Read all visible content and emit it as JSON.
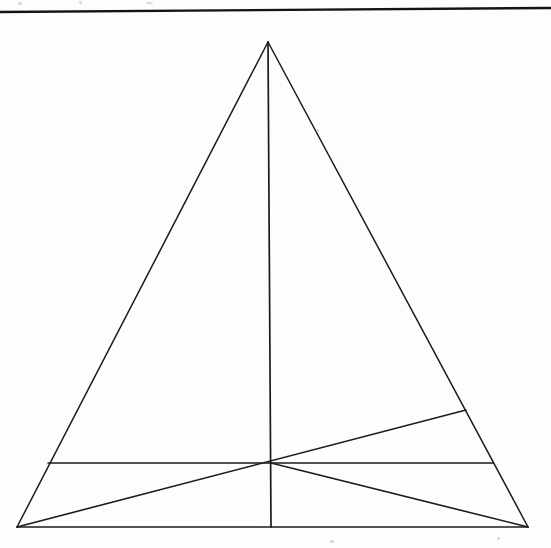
{
  "page": {
    "width": 551,
    "height": 548,
    "background_color": "#fdfdfc",
    "ink_color": "#1b1b1b"
  },
  "header_rule": {
    "name": "horizontal-rule",
    "x1": 0,
    "y1": 12,
    "x2": 551,
    "y2": 8,
    "stroke_width": 2.4,
    "color": "#141414"
  },
  "scan_artifacts": [
    {
      "x": 18,
      "y": 2,
      "w": 4,
      "h": 3
    },
    {
      "x": 79,
      "y": 1,
      "w": 3,
      "h": 3
    },
    {
      "x": 146,
      "y": 2,
      "w": 7,
      "h": 2
    },
    {
      "x": 316,
      "y": 129,
      "w": 3,
      "h": 3
    },
    {
      "x": 330,
      "y": 540,
      "w": 4,
      "h": 3
    },
    {
      "x": 497,
      "y": 537,
      "w": 3,
      "h": 3
    }
  ],
  "chart_data": {
    "type": "diagram",
    "xlabel": "",
    "ylabel": "",
    "xlim": [
      0,
      551
    ],
    "ylim": [
      0,
      548
    ],
    "grid": false,
    "legend": "none",
    "points": [
      {
        "id": "A",
        "role": "apex",
        "x": 268,
        "y": 42
      },
      {
        "id": "B",
        "role": "base-left-vertex",
        "x": 17,
        "y": 527
      },
      {
        "id": "C",
        "role": "base-right-vertex",
        "x": 528,
        "y": 527
      },
      {
        "id": "M",
        "role": "base-midpoint",
        "x": 271,
        "y": 527
      },
      {
        "id": "P",
        "role": "interior-hub",
        "x": 271,
        "y": 463
      },
      {
        "id": "L",
        "role": "chord-left-endpoint-on-left-side",
        "x": 48,
        "y": 463
      },
      {
        "id": "R",
        "role": "chord-right-endpoint-on-right-side",
        "x": 493,
        "y": 463
      },
      {
        "id": "Q",
        "role": "cevian-endpoint-on-right-side",
        "x": 466,
        "y": 410
      }
    ],
    "segments": [
      {
        "id": "s1",
        "name": "triangle-left-side",
        "from": "A",
        "to": "B",
        "x1": 268,
        "y1": 42,
        "x2": 17,
        "y2": 527,
        "stroke_width": 1.5
      },
      {
        "id": "s2",
        "name": "triangle-right-side",
        "from": "A",
        "to": "C",
        "x1": 268,
        "y1": 42,
        "x2": 528,
        "y2": 527,
        "stroke_width": 1.5
      },
      {
        "id": "s3",
        "name": "triangle-base",
        "from": "B",
        "to": "C",
        "x1": 17,
        "y1": 527,
        "x2": 528,
        "y2": 527,
        "stroke_width": 1.7
      },
      {
        "id": "s4",
        "name": "vertical-median",
        "from": "A",
        "to": "M",
        "x1": 268,
        "y1": 42,
        "x2": 271,
        "y2": 527,
        "stroke_width": 1.7
      },
      {
        "id": "s5",
        "name": "horizontal-chord",
        "from": "L",
        "to": "R",
        "x1": 48,
        "y1": 463,
        "x2": 493,
        "y2": 463,
        "stroke_width": 1.5
      },
      {
        "id": "s6",
        "name": "cevian-left-base-to-hub",
        "from": "B",
        "to": "Q",
        "x1": 17,
        "y1": 527,
        "x2": 466,
        "y2": 410,
        "stroke_width": 1.6
      },
      {
        "id": "s7",
        "name": "cevian-right-base-to-hub",
        "from": "C",
        "to": "P",
        "x1": 528,
        "y1": 527,
        "x2": 271,
        "y2": 463,
        "stroke_width": 1.6
      }
    ]
  }
}
